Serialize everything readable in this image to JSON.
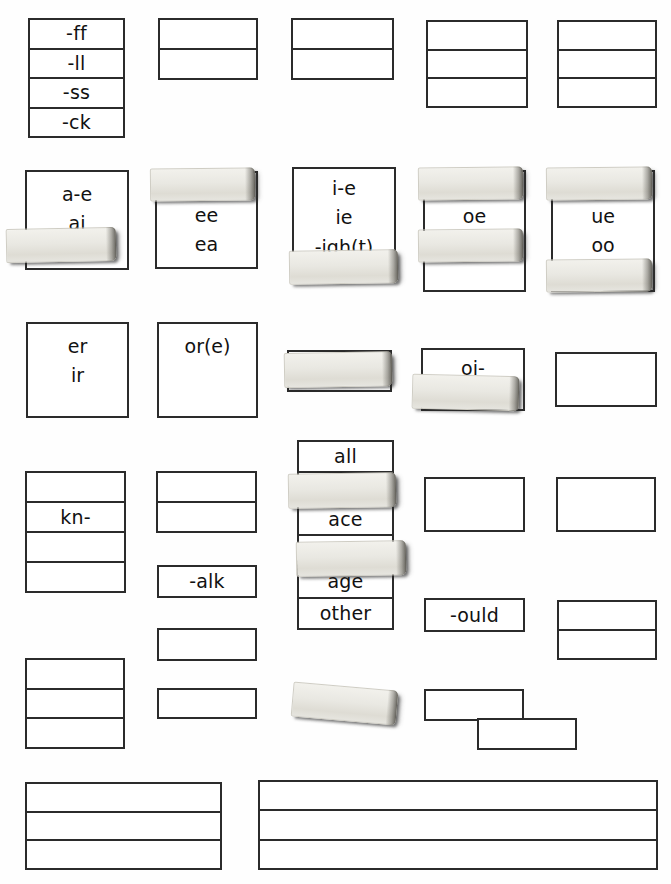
{
  "page": {
    "background": "#ffffff",
    "ink": "#2b2b2b",
    "strip_color": "#e9e8e2"
  },
  "rows": [
    {
      "name": "row-1",
      "boxes": [
        {
          "name": "box-ff-ll-ss-ck",
          "cells": [
            "-ff",
            "-ll",
            "-ss",
            "-ck"
          ]
        },
        {
          "name": "box-r1-c2",
          "cells": [
            "",
            ""
          ]
        },
        {
          "name": "box-r1-c3",
          "cells": [
            "",
            ""
          ]
        },
        {
          "name": "box-r1-c4",
          "cells": [
            "",
            "",
            ""
          ]
        },
        {
          "name": "box-r1-c5",
          "cells": [
            "",
            "",
            ""
          ]
        }
      ]
    },
    {
      "name": "row-2",
      "boxes": [
        {
          "name": "box-a-e-ai",
          "lines": [
            "a-e",
            "ai"
          ]
        },
        {
          "name": "box-ee-ea",
          "lines": [
            "ee",
            "ea"
          ]
        },
        {
          "name": "box-i-e-ie-igh",
          "lines": [
            "i-e",
            "ie",
            "-igh(t)"
          ]
        },
        {
          "name": "box-oe-ow",
          "lines": [
            "oe",
            "ow"
          ]
        },
        {
          "name": "box-ue-oo",
          "lines": [
            "ue",
            "oo"
          ]
        }
      ]
    },
    {
      "name": "row-3",
      "boxes": [
        {
          "name": "box-er-ir",
          "lines": [
            "er",
            "ir"
          ]
        },
        {
          "name": "box-or-e",
          "lines": [
            "or(e)"
          ]
        },
        {
          "name": "box-r3-c3",
          "lines": []
        },
        {
          "name": "box-oi",
          "lines": [
            "oi-"
          ]
        },
        {
          "name": "box-r3-c5",
          "lines": []
        }
      ]
    },
    {
      "name": "row-4",
      "boxes": [
        {
          "name": "box-kn",
          "cells": [
            "",
            "kn-",
            "",
            ""
          ]
        },
        {
          "name": "box-r4-c2",
          "cells": [
            "",
            ""
          ]
        },
        {
          "name": "box-all-ace-age-other",
          "cells": [
            "all",
            "",
            "ace",
            "",
            "age",
            "other"
          ]
        },
        {
          "name": "box-r4-c4",
          "cells": [
            ""
          ]
        },
        {
          "name": "box-r4-c5",
          "cells": [
            ""
          ]
        },
        {
          "name": "box-alk",
          "cells": [
            "-alk"
          ]
        },
        {
          "name": "box-ould",
          "cells": [
            "-ould"
          ]
        },
        {
          "name": "box-r4-c7",
          "cells": [
            "",
            ""
          ]
        }
      ]
    },
    {
      "name": "row-5",
      "boxes": [
        {
          "name": "box-r5-c1",
          "cells": [
            "",
            "",
            ""
          ]
        },
        {
          "name": "box-r5-c2",
          "cells": [
            ""
          ]
        },
        {
          "name": "box-r5-c3",
          "cells": [
            ""
          ]
        },
        {
          "name": "box-r5-c4",
          "cells": [
            ""
          ]
        },
        {
          "name": "box-r5-c5",
          "cells": [
            ""
          ]
        }
      ]
    },
    {
      "name": "row-6",
      "boxes": [
        {
          "name": "box-bottom-left",
          "cells": [
            "",
            "",
            ""
          ]
        },
        {
          "name": "box-bottom-right",
          "cells": [
            "",
            "",
            ""
          ]
        }
      ]
    }
  ],
  "strips": [
    {
      "name": "strip-a-e-ai-bottom"
    },
    {
      "name": "strip-ee-top"
    },
    {
      "name": "strip-i-e-bottom"
    },
    {
      "name": "strip-oe-top"
    },
    {
      "name": "strip-oe-middle"
    },
    {
      "name": "strip-ue-top"
    },
    {
      "name": "strip-ue-bottom"
    },
    {
      "name": "strip-r3-c3"
    },
    {
      "name": "strip-oi-bottom"
    },
    {
      "name": "strip-all-row2"
    },
    {
      "name": "strip-all-row4"
    },
    {
      "name": "strip-r5-tilted"
    }
  ]
}
